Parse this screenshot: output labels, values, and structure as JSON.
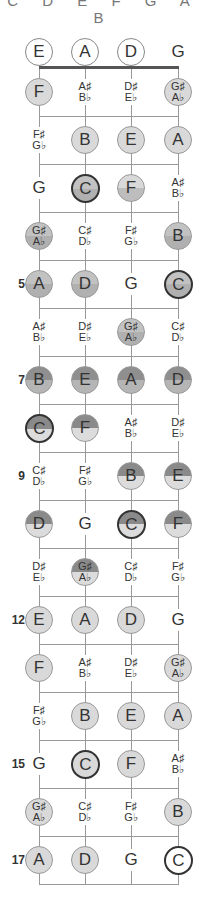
{
  "header": {
    "text": "C D E F G A B"
  },
  "layout": {
    "strings_x": [
      39,
      85,
      131,
      178
    ],
    "open_row_y": 52,
    "nut_y": 68,
    "fret_spacing": 48
  },
  "colors": {
    "light": "#d9d9d9",
    "mid": "#b0b0b0",
    "dark": "#8a8a8a",
    "root_border": "#333333",
    "lines": "#999999"
  },
  "fret_numbers": [
    {
      "fret": 5,
      "label": "5"
    },
    {
      "fret": 7,
      "label": "7"
    },
    {
      "fret": 9,
      "label": "9"
    },
    {
      "fret": 12,
      "label": "12"
    },
    {
      "fret": 15,
      "label": "15"
    },
    {
      "fret": 17,
      "label": "17"
    }
  ],
  "rows": [
    [
      {
        "n": "E",
        "s": "open"
      },
      {
        "n": "A",
        "s": "open"
      },
      {
        "n": "D",
        "s": "open"
      },
      {
        "n": "G",
        "s": "text"
      }
    ],
    [
      {
        "n": "F",
        "s": "light"
      },
      {
        "n": "A♯\nB♭",
        "s": "text"
      },
      {
        "n": "D♯\nE♭",
        "s": "text"
      },
      {
        "n": "G♯\nA♭",
        "s": "light"
      }
    ],
    [
      {
        "n": "F♯\nG♭",
        "s": "text"
      },
      {
        "n": "B",
        "s": "light"
      },
      {
        "n": "E",
        "s": "light"
      },
      {
        "n": "A",
        "s": "light"
      }
    ],
    [
      {
        "n": "G",
        "s": "text"
      },
      {
        "n": "C",
        "s": "mid root"
      },
      {
        "n": "F",
        "s": "lightmid"
      },
      {
        "n": "A♯\nB♭",
        "s": "text"
      }
    ],
    [
      {
        "n": "G♯\nA♭",
        "s": "mid"
      },
      {
        "n": "C♯\nD♭",
        "s": "text"
      },
      {
        "n": "F♯\nG♭",
        "s": "text"
      },
      {
        "n": "B",
        "s": "mid"
      }
    ],
    [
      {
        "n": "A",
        "s": "mid"
      },
      {
        "n": "D",
        "s": "mid"
      },
      {
        "n": "G",
        "s": "text"
      },
      {
        "n": "C",
        "s": "mid root"
      }
    ],
    [
      {
        "n": "A♯\nB♭",
        "s": "text"
      },
      {
        "n": "D♯\nE♭",
        "s": "text"
      },
      {
        "n": "G♯\nA♭",
        "s": "mid"
      },
      {
        "n": "C♯\nD♭",
        "s": "text"
      }
    ],
    [
      {
        "n": "B",
        "s": "darkmid"
      },
      {
        "n": "E",
        "s": "darkmid"
      },
      {
        "n": "A",
        "s": "darkmid"
      },
      {
        "n": "D",
        "s": "darkmid"
      }
    ],
    [
      {
        "n": "C",
        "s": "darklight root"
      },
      {
        "n": "F",
        "s": "darklight"
      },
      {
        "n": "A♯\nB♭",
        "s": "text"
      },
      {
        "n": "D♯\nE♭",
        "s": "text"
      }
    ],
    [
      {
        "n": "C♯\nD♭",
        "s": "text"
      },
      {
        "n": "F♯\nG♭",
        "s": "text"
      },
      {
        "n": "B",
        "s": "darklight"
      },
      {
        "n": "E",
        "s": "darklight"
      }
    ],
    [
      {
        "n": "D",
        "s": "darklight"
      },
      {
        "n": "G",
        "s": "text"
      },
      {
        "n": "C",
        "s": "darklight root"
      },
      {
        "n": "F",
        "s": "darklight"
      }
    ],
    [
      {
        "n": "D♯\nE♭",
        "s": "text"
      },
      {
        "n": "G♯\nA♭",
        "s": "darklight"
      },
      {
        "n": "C♯\nD♭",
        "s": "text"
      },
      {
        "n": "F♯\nG♭",
        "s": "text"
      }
    ],
    [
      {
        "n": "E",
        "s": "light"
      },
      {
        "n": "A",
        "s": "light"
      },
      {
        "n": "D",
        "s": "light"
      },
      {
        "n": "G",
        "s": "text"
      }
    ],
    [
      {
        "n": "F",
        "s": "light"
      },
      {
        "n": "A♯\nB♭",
        "s": "text"
      },
      {
        "n": "D♯\nE♭",
        "s": "text"
      },
      {
        "n": "G♯\nA♭",
        "s": "light"
      }
    ],
    [
      {
        "n": "F♯\nG♭",
        "s": "text"
      },
      {
        "n": "B",
        "s": "light"
      },
      {
        "n": "E",
        "s": "light"
      },
      {
        "n": "A",
        "s": "light"
      }
    ],
    [
      {
        "n": "G",
        "s": "text"
      },
      {
        "n": "C",
        "s": "light root"
      },
      {
        "n": "F",
        "s": "light"
      },
      {
        "n": "A♯\nB♭",
        "s": "text"
      }
    ],
    [
      {
        "n": "G♯\nA♭",
        "s": "light"
      },
      {
        "n": "C♯\nD♭",
        "s": "text"
      },
      {
        "n": "F♯\nG♭",
        "s": "text"
      },
      {
        "n": "B",
        "s": "light"
      }
    ],
    [
      {
        "n": "A",
        "s": "light"
      },
      {
        "n": "D",
        "s": "light"
      },
      {
        "n": "G",
        "s": "text"
      },
      {
        "n": "C",
        "s": "whiteroot"
      }
    ]
  ]
}
